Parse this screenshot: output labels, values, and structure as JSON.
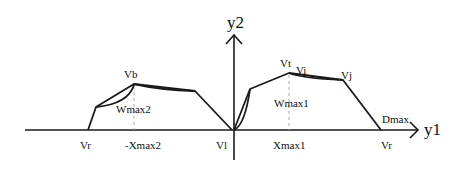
{
  "diagram": {
    "axes": {
      "x_label": "y1",
      "y_label": "y2"
    },
    "labels": {
      "vb": "Vb",
      "wmax2": "Wmax2",
      "vr_left": "Vr",
      "neg_xmax2": "-Xmax2",
      "vl": "Vl",
      "vt": "Vt",
      "vi": "Vi",
      "vj": "Vj",
      "wmax1": "Wmax1",
      "xmax1": "Xmax1",
      "dmax": "Dmax",
      "vr_right": "Vr"
    },
    "colors": {
      "line": "#1a1a1a",
      "dashed": "#aaaaaa",
      "background": "#ffffff"
    }
  }
}
